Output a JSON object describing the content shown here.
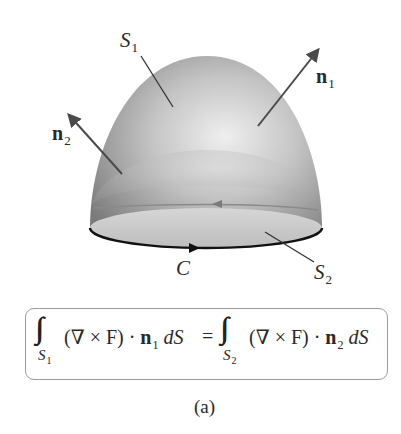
{
  "figure": {
    "caption": "(a)",
    "surface_top": {
      "name": "S",
      "sub": "1"
    },
    "surface_bottom": {
      "name": "S",
      "sub": "2"
    },
    "normal_top": {
      "name": "n",
      "sub": "1"
    },
    "normal_bottom": {
      "name": "n",
      "sub": "2"
    },
    "curve": {
      "name": "C"
    },
    "colors": {
      "dome_dark": "#7d7d7d",
      "dome_light": "#ececec",
      "disk": "#c9c9c9",
      "arrow": "#4a4a4a",
      "boundary": "#111111",
      "box_border": "#9a9a9a"
    }
  },
  "formula": {
    "lhs": {
      "integral": "∫∫",
      "domain": {
        "name": "S",
        "sub": "1"
      },
      "integrand": "(∇ × F) · ",
      "normal": {
        "name": "n",
        "sub": "1"
      },
      "differential": "dS"
    },
    "equals": "=",
    "rhs": {
      "integral": "∫∫",
      "domain": {
        "name": "S",
        "sub": "2"
      },
      "integrand": "(∇ × F) · ",
      "normal": {
        "name": "n",
        "sub": "2"
      },
      "differential": "dS"
    }
  }
}
